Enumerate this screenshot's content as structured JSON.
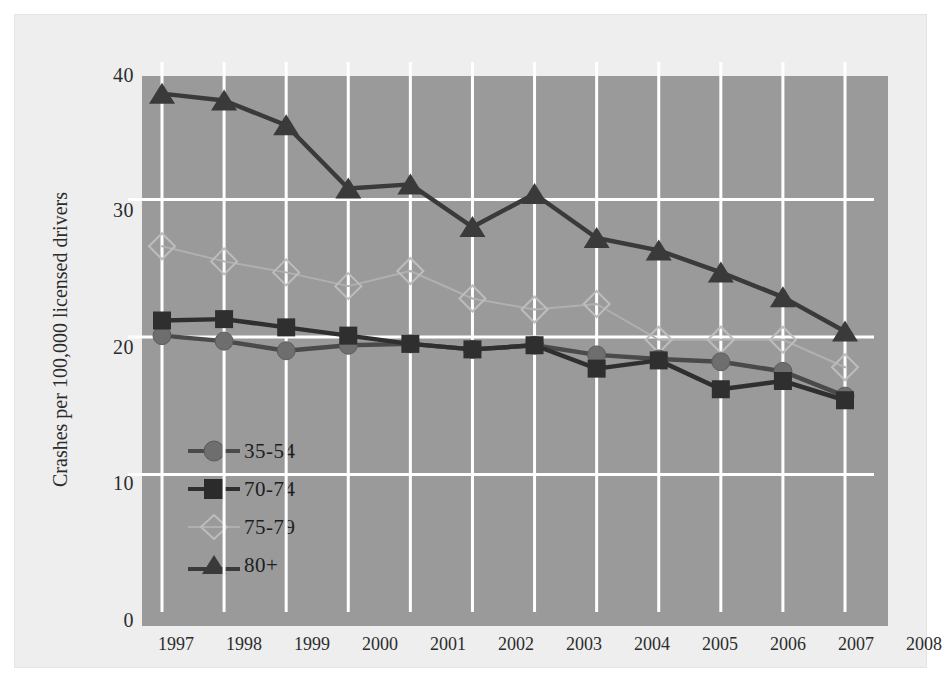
{
  "chart_data": {
    "type": "line",
    "title": "",
    "subtitle": "",
    "xlabel": "",
    "ylabel": "Crashes per 100,000 licensed drivers",
    "categories": [
      "1997",
      "1998",
      "1999",
      "2000",
      "2001",
      "2002",
      "2003",
      "2004",
      "2005",
      "2006",
      "2007",
      "2008"
    ],
    "x": [
      1997,
      1998,
      1999,
      2000,
      2001,
      2002,
      2003,
      2004,
      2005,
      2006,
      2007,
      2008
    ],
    "xlim": [
      1996.5,
      2008.5
    ],
    "ylim": [
      0,
      40
    ],
    "yticks": [
      0,
      10,
      20,
      30,
      40
    ],
    "ytick_labels": [
      "0",
      "10",
      "20",
      "30",
      "40"
    ],
    "grid": "both-axes-white-lines",
    "legend_position": "inside-lower-left",
    "plot_background": "#9a9a9a",
    "page_background": "#eeeeee",
    "gridline_color": "#ffffff",
    "series": [
      {
        "name": "35-54",
        "marker": "circle",
        "color": "#6e6e6e",
        "line_color": "#4a4a4a",
        "values": [
          20.1,
          19.7,
          19.0,
          19.4,
          19.5,
          19.1,
          19.4,
          18.7,
          18.4,
          18.2,
          17.5,
          15.7
        ]
      },
      {
        "name": "70-74",
        "marker": "square",
        "color": "#2f2f2f",
        "line_color": "#2f2f2f",
        "values": [
          21.2,
          21.3,
          20.7,
          20.1,
          19.5,
          19.1,
          19.4,
          17.7,
          18.3,
          16.2,
          16.8,
          15.4
        ]
      },
      {
        "name": "75-79",
        "marker": "diamond-open",
        "color": "#bdbdbd",
        "line_color": "#b0b0b0",
        "values": [
          26.6,
          25.5,
          24.7,
          23.7,
          24.8,
          22.8,
          22.0,
          22.4,
          19.8,
          19.8,
          19.8,
          17.8
        ]
      },
      {
        "name": "80+",
        "marker": "triangle",
        "color": "#3a3a3a",
        "line_color": "#3a3a3a",
        "values": [
          37.7,
          37.2,
          35.4,
          30.8,
          31.1,
          28.0,
          30.4,
          27.2,
          26.3,
          24.7,
          22.9,
          20.4
        ]
      }
    ]
  },
  "legend": {
    "items": [
      {
        "label": "35-54"
      },
      {
        "label": "70-74"
      },
      {
        "label": "75-79"
      },
      {
        "label": "80+"
      }
    ]
  },
  "axes": {
    "y_title": "Crashes per 100,000 licensed drivers",
    "y_ticks": [
      "40",
      "30",
      "20",
      "10",
      "0"
    ],
    "x_ticks": [
      "1997",
      "1998",
      "1999",
      "2000",
      "2001",
      "2002",
      "2003",
      "2004",
      "2005",
      "2006",
      "2007",
      "2008"
    ]
  }
}
